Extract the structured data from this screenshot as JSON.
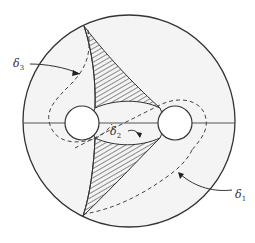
{
  "figure": {
    "disk": {
      "cx": 129,
      "cy": 121,
      "r": 106,
      "fill": "#f4f4f4",
      "stroke": "#333333"
    },
    "holes": [
      {
        "name": "left",
        "cx": 82,
        "cy": 123,
        "r": 17
      },
      {
        "name": "right",
        "cx": 175,
        "cy": 123,
        "r": 17
      }
    ],
    "axis_line_y": 123,
    "labels": [
      {
        "id": "delta3",
        "symbol": "δ",
        "sub": "3",
        "x": 13,
        "y": 58
      },
      {
        "id": "delta2",
        "symbol": "δ",
        "sub": "2",
        "x": 110,
        "y": 126
      },
      {
        "id": "delta1",
        "symbol": "δ",
        "sub": "1",
        "x": 235,
        "y": 189
      }
    ]
  }
}
